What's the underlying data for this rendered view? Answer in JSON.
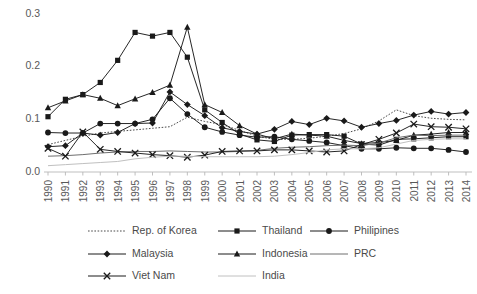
{
  "chart_data": {
    "type": "line",
    "title": "",
    "xlabel": "",
    "ylabel": "",
    "ylim": [
      0.0,
      0.3
    ],
    "yticks": [
      0.0,
      0.1,
      0.2,
      0.3
    ],
    "ytick_labels": [
      "0.0",
      "0.1",
      "0.2",
      "0.3"
    ],
    "grid": false,
    "legend_position": "bottom",
    "categories": [
      "1990",
      "1991",
      "1992",
      "1993",
      "1994",
      "1995",
      "1996",
      "1997",
      "1998",
      "1999",
      "2000",
      "2001",
      "2002",
      "2003",
      "2004",
      "2005",
      "2006",
      "2007",
      "2008",
      "2009",
      "2010",
      "2011",
      "2012",
      "2013",
      "2014"
    ],
    "series": [
      {
        "name": "Rep. of Korea",
        "marker": "none",
        "line_style": "dotted",
        "color": "#4a4a4a",
        "values": [
          0.052,
          0.06,
          0.068,
          0.074,
          0.077,
          0.08,
          0.083,
          0.086,
          0.104,
          0.096,
          0.09,
          0.079,
          0.068,
          0.062,
          0.062,
          0.064,
          0.068,
          0.073,
          0.082,
          0.097,
          0.118,
          0.107,
          0.102,
          0.1,
          0.099
        ]
      },
      {
        "name": "Thailand",
        "marker": "square",
        "line_style": "solid",
        "color": "#1a1a1a",
        "values": [
          0.105,
          0.138,
          0.147,
          0.17,
          0.212,
          0.265,
          0.258,
          0.265,
          0.218,
          0.118,
          0.094,
          0.072,
          0.061,
          0.058,
          0.07,
          0.071,
          0.071,
          0.068,
          0.053,
          0.051,
          0.062,
          0.063,
          0.065,
          0.067,
          0.067
        ]
      },
      {
        "name": "Philipines",
        "marker": "circle",
        "line_style": "solid",
        "color": "#1a1a1a",
        "values": [
          0.075,
          0.074,
          0.074,
          0.092,
          0.092,
          0.092,
          0.1,
          0.14,
          0.11,
          0.085,
          0.076,
          0.07,
          0.066,
          0.067,
          0.062,
          0.059,
          0.056,
          0.05,
          0.044,
          0.044,
          0.046,
          0.045,
          0.045,
          0.042,
          0.038
        ]
      },
      {
        "name": "Malaysia",
        "marker": "diamond",
        "line_style": "solid",
        "color": "#1a1a1a",
        "values": [
          0.048,
          0.05,
          0.074,
          0.07,
          0.075,
          0.092,
          0.093,
          0.152,
          0.128,
          0.107,
          0.084,
          0.077,
          0.072,
          0.081,
          0.096,
          0.09,
          0.102,
          0.097,
          0.085,
          0.092,
          0.098,
          0.108,
          0.115,
          0.11,
          0.113
        ]
      },
      {
        "name": "Indonesia",
        "marker": "triangle",
        "line_style": "solid",
        "color": "#1a1a1a",
        "values": [
          0.122,
          0.135,
          0.147,
          0.14,
          0.126,
          0.139,
          0.151,
          0.165,
          0.275,
          0.128,
          0.113,
          0.088,
          0.072,
          0.063,
          0.072,
          0.07,
          0.068,
          0.06,
          0.054,
          0.056,
          0.06,
          0.07,
          0.072,
          0.075,
          0.075
        ]
      },
      {
        "name": "PRC",
        "marker": "none",
        "line_style": "solid",
        "color": "#6e6e6e",
        "values": [
          0.03,
          0.031,
          0.033,
          0.036,
          0.038,
          0.039,
          0.039,
          0.04,
          0.039,
          0.038,
          0.038,
          0.039,
          0.041,
          0.045,
          0.047,
          0.048,
          0.05,
          0.051,
          0.05,
          0.055,
          0.065,
          0.07,
          0.069,
          0.07,
          0.07
        ]
      },
      {
        "name": "Viet Nam",
        "marker": "cross",
        "line_style": "solid",
        "color": "#1a1a1a",
        "values": [
          0.045,
          0.03,
          0.076,
          0.043,
          0.039,
          0.036,
          0.033,
          0.031,
          0.028,
          0.032,
          0.039,
          0.04,
          0.04,
          0.042,
          0.042,
          0.04,
          0.038,
          0.04,
          0.052,
          0.062,
          0.074,
          0.091,
          0.086,
          0.085,
          0.082
        ]
      },
      {
        "name": "India",
        "marker": "none",
        "line_style": "solid",
        "color": "#c0c0c0",
        "values": [
          0.012,
          0.014,
          0.016,
          0.018,
          0.02,
          0.025,
          0.028,
          0.03,
          0.03,
          0.029,
          0.029,
          0.029,
          0.029,
          0.03,
          0.033,
          0.037,
          0.042,
          0.044,
          0.044,
          0.046,
          0.053,
          0.06,
          0.062,
          0.063,
          0.063
        ]
      }
    ],
    "legend_rows": [
      [
        "Rep. of Korea",
        "Thailand",
        "Philipines"
      ],
      [
        "Malaysia",
        "Indonesia",
        "PRC"
      ],
      [
        "Viet Nam",
        "India"
      ]
    ]
  }
}
